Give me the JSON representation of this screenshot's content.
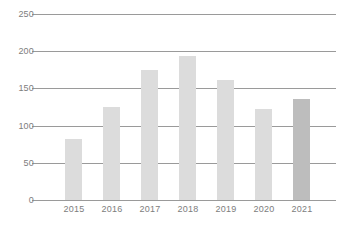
{
  "chart_data": {
    "type": "bar",
    "title": "",
    "subtitle": "",
    "xlabel": "",
    "ylabel": "",
    "categories": [
      "2015",
      "2016",
      "2017",
      "2018",
      "2019",
      "2020",
      "2021"
    ],
    "values": [
      82,
      125,
      175,
      193,
      162,
      123,
      136
    ],
    "series": [
      {
        "name": "",
        "values": [
          82,
          125,
          175,
          193,
          162,
          123,
          136
        ]
      }
    ],
    "ylim": [
      0,
      250
    ],
    "yticks": [
      0,
      50,
      100,
      150,
      200,
      250
    ],
    "ytick_labels": [
      "0",
      "50",
      "100",
      "150",
      "200",
      "250"
    ],
    "xtick_labels": [
      "2015",
      "2016",
      "2017",
      "2018",
      "2019",
      "2020",
      "2021"
    ],
    "grid": true,
    "grid_axis": "y",
    "legend": false,
    "legend_position": "none",
    "annotations": [],
    "bar_colors": [
      "#dcdcdc",
      "#dcdcdc",
      "#dcdcdc",
      "#dcdcdc",
      "#dcdcdc",
      "#dcdcdc",
      "#bdbdbd"
    ],
    "highlight_category": "2021"
  },
  "style": {
    "background": "#ffffff",
    "grid_color": "#9a9a9a",
    "axis_color": "#9a9a9a",
    "tick_label_color": "#7d7d7d",
    "bar_color": "#dcdcdc",
    "bar_highlight_color": "#bdbdbd"
  }
}
